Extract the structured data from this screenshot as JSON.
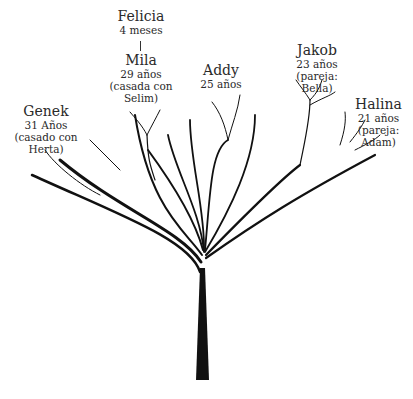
{
  "title": "",
  "members": [
    {
      "id": "felicia",
      "name": "Felicia",
      "details": [
        "4 meses"
      ]
    },
    {
      "id": "mila",
      "name": "Mila",
      "details": [
        "29 años",
        "(casada con Selim)"
      ]
    },
    {
      "id": "genek",
      "name": "Genek",
      "details": [
        "31 Años",
        "(casado con Herta)"
      ]
    },
    {
      "id": "addy",
      "name": "Addy",
      "details": [
        "25 años"
      ]
    },
    {
      "id": "jakob",
      "name": "Jakob",
      "details": [
        "23 años",
        "(pareja: Bella)"
      ]
    },
    {
      "id": "halina",
      "name": "Halina",
      "details": [
        "21 años",
        "(pareja: Adam)"
      ]
    }
  ],
  "colors": {
    "tree": "#111111",
    "text": "#2a2a2a",
    "background": "#ffffff"
  }
}
